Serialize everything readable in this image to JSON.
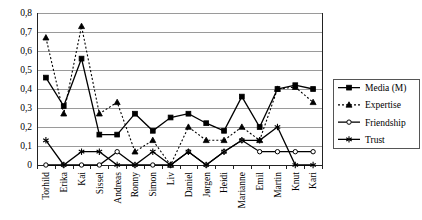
{
  "chart_data": {
    "type": "line",
    "title": "",
    "xlabel": "",
    "ylabel": "",
    "ylim": [
      0,
      0.8
    ],
    "grid": true,
    "legend_position": "right",
    "ytick_labels": [
      "0",
      "0,1",
      "0,2",
      "0,3",
      "0,4",
      "0,5",
      "0,6",
      "0,7",
      "0,8"
    ],
    "ytick_values": [
      0,
      0.1,
      0.2,
      0.3,
      0.4,
      0.5,
      0.6,
      0.7,
      0.8
    ],
    "categories": [
      "Torhild",
      "Erika",
      "Kai",
      "Sissel",
      "Andreas",
      "Ronny",
      "Simon",
      "Liv",
      "Daniel",
      "Jørgen",
      "Heidi",
      "Marianne",
      "Emil",
      "Martin",
      "Knut",
      "Kari"
    ],
    "series": [
      {
        "name": "Media (M)",
        "marker": "filled-square",
        "linestyle": "solid",
        "color": "#000000",
        "values": [
          0.46,
          0.31,
          0.56,
          0.16,
          0.16,
          0.27,
          0.18,
          0.25,
          0.27,
          0.22,
          0.18,
          0.36,
          0.2,
          0.4,
          0.42,
          0.4
        ]
      },
      {
        "name": "Expertise",
        "marker": "filled-triangle",
        "linestyle": "dotted",
        "color": "#000000",
        "values": [
          0.67,
          0.27,
          0.73,
          0.27,
          0.33,
          0.07,
          0.13,
          0.0,
          0.2,
          0.13,
          0.13,
          0.2,
          0.13,
          0.4,
          0.41,
          0.33
        ]
      },
      {
        "name": "Friendship",
        "marker": "open-circle",
        "linestyle": "solid",
        "color": "#000000",
        "values": [
          0.0,
          0.0,
          0.0,
          0.0,
          0.07,
          0.0,
          0.0,
          0.0,
          0.07,
          0.0,
          0.07,
          0.13,
          0.07,
          0.07,
          0.07,
          0.07
        ]
      },
      {
        "name": "Trust",
        "marker": "star",
        "linestyle": "solid",
        "color": "#000000",
        "values": [
          0.13,
          0.0,
          0.07,
          0.07,
          0.0,
          0.0,
          0.07,
          0.0,
          0.07,
          0.0,
          0.07,
          0.13,
          0.13,
          0.2,
          0.0,
          0.0
        ]
      }
    ]
  },
  "legend": {
    "entries": [
      {
        "label": "Media (M)"
      },
      {
        "label": "Expertise"
      },
      {
        "label": "Friendship"
      },
      {
        "label": "Trust"
      }
    ]
  }
}
